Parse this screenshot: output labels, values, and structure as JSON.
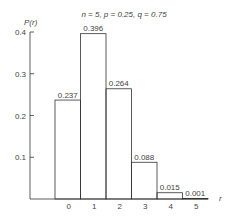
{
  "chart_data": {
    "type": "bar",
    "title": "n = 5, p = 0.25, q = 0.75",
    "xlabel": "r",
    "ylabel": "P(r)",
    "categories": [
      "0",
      "1",
      "2",
      "3",
      "4",
      "5"
    ],
    "values": [
      0.237,
      0.396,
      0.264,
      0.088,
      0.015,
      0.001
    ],
    "value_labels": [
      "0.237",
      "0.396",
      "0.264",
      "0.088",
      "0.015",
      "0.001"
    ],
    "yticks": [
      "0.1",
      "0.2",
      "0.3",
      "0.4"
    ],
    "ylim": [
      0,
      0.4
    ],
    "grid": false,
    "legend": null,
    "bar_style": "outlined, adjacent (histogram)",
    "line_color": "#333333"
  }
}
